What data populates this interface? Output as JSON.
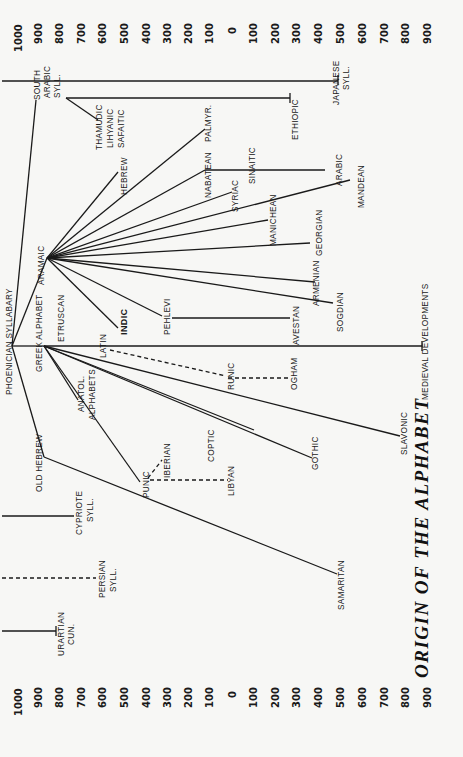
{
  "title": "ORIGIN OF THE ALPHABET",
  "axis": {
    "top_years": [
      "1000",
      "900",
      "800",
      "700",
      "600",
      "500",
      "400",
      "300",
      "200",
      "100",
      "0",
      "100",
      "200",
      "300",
      "400",
      "500",
      "600",
      "700",
      "800",
      "900"
    ],
    "bottom_years": [
      "1000",
      "900",
      "800",
      "700",
      "600",
      "500",
      "400",
      "300",
      "200",
      "100",
      "0",
      "100",
      "200",
      "300",
      "400",
      "500",
      "600",
      "700",
      "800",
      "900"
    ]
  },
  "nodes": {
    "phoenician": "PHOENICIAN SYLLABARY",
    "south_arabic": [
      "SOUTH",
      "ARABIC",
      "SYLL."
    ],
    "thamudic": [
      "THAMUDIC",
      "LIHYANIC",
      "SAFAITIC"
    ],
    "ethiopic": "ETHIOPIC",
    "japanese": [
      "JAPANESE",
      "SYLL."
    ],
    "aramaic": "ARAMAIC",
    "hebrew": "HEBREW",
    "nabatean": "NABATEAN",
    "palmyr": "PALMYR.",
    "sinaitic": "SINAITIC",
    "arabic": "ARABIC",
    "syriac": "SYRIAC",
    "mandean": "MANDEAN",
    "manichean": "MANICHEAN",
    "georgian": "GEORGIAN",
    "armenian": "ARMENIAN",
    "sogdian": "SOGDIAN",
    "indic": "INDIC",
    "pehlevi": "PEHLEVI",
    "avestan": "AVESTAN",
    "greek": "GREEK ALPHABET",
    "etruscan": "ETRUSCAN",
    "latin": "LATIN",
    "medieval": "MEDIEVAL DEVELOPMENTS",
    "runic": "RUNIC",
    "ogham": "OGHAM",
    "anatol": [
      "ANATOL.",
      "ALPHABETS"
    ],
    "coptic": "COPTIC",
    "gothic": "GOTHIC",
    "slavonic": "SLAVONIC",
    "old_hebrew": "OLD HEBREW",
    "samaritan": "SAMARITAN",
    "punic": "PUNIC",
    "iberian": "IBERIAN",
    "libyan": "LIBYAN",
    "cypriote": [
      "CYPRIOTE",
      "SYLL."
    ],
    "persian": [
      "PERSIAN",
      "SYLL."
    ],
    "urartian": [
      "URARTIAN",
      "CUN."
    ]
  }
}
